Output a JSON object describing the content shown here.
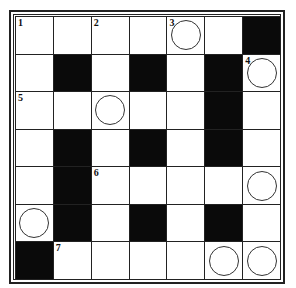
{
  "puzzle": {
    "rows": 7,
    "cols": 7,
    "colors": {
      "black": "#0a0a0a",
      "white": "#ffffff",
      "line": "#222222"
    },
    "cells": [
      [
        {
          "t": "w",
          "n": "1"
        },
        {
          "t": "w"
        },
        {
          "t": "w",
          "n": "2"
        },
        {
          "t": "w"
        },
        {
          "t": "w",
          "n": "3",
          "c": true
        },
        {
          "t": "w"
        },
        {
          "t": "b"
        }
      ],
      [
        {
          "t": "w"
        },
        {
          "t": "b"
        },
        {
          "t": "w"
        },
        {
          "t": "b"
        },
        {
          "t": "w"
        },
        {
          "t": "b"
        },
        {
          "t": "w",
          "n": "4",
          "c": true
        }
      ],
      [
        {
          "t": "w",
          "n": "5"
        },
        {
          "t": "w"
        },
        {
          "t": "w",
          "c": true
        },
        {
          "t": "w"
        },
        {
          "t": "w"
        },
        {
          "t": "b"
        },
        {
          "t": "w"
        }
      ],
      [
        {
          "t": "w"
        },
        {
          "t": "b"
        },
        {
          "t": "w"
        },
        {
          "t": "b"
        },
        {
          "t": "w"
        },
        {
          "t": "b"
        },
        {
          "t": "w"
        }
      ],
      [
        {
          "t": "w"
        },
        {
          "t": "b"
        },
        {
          "t": "w",
          "n": "6"
        },
        {
          "t": "w"
        },
        {
          "t": "w"
        },
        {
          "t": "w"
        },
        {
          "t": "w",
          "c": true
        }
      ],
      [
        {
          "t": "w",
          "c": true
        },
        {
          "t": "b"
        },
        {
          "t": "w"
        },
        {
          "t": "b"
        },
        {
          "t": "w"
        },
        {
          "t": "b"
        },
        {
          "t": "w"
        }
      ],
      [
        {
          "t": "b"
        },
        {
          "t": "w",
          "n": "7"
        },
        {
          "t": "w"
        },
        {
          "t": "w"
        },
        {
          "t": "w"
        },
        {
          "t": "w",
          "c": true
        },
        {
          "t": "w",
          "c": true
        }
      ]
    ]
  }
}
